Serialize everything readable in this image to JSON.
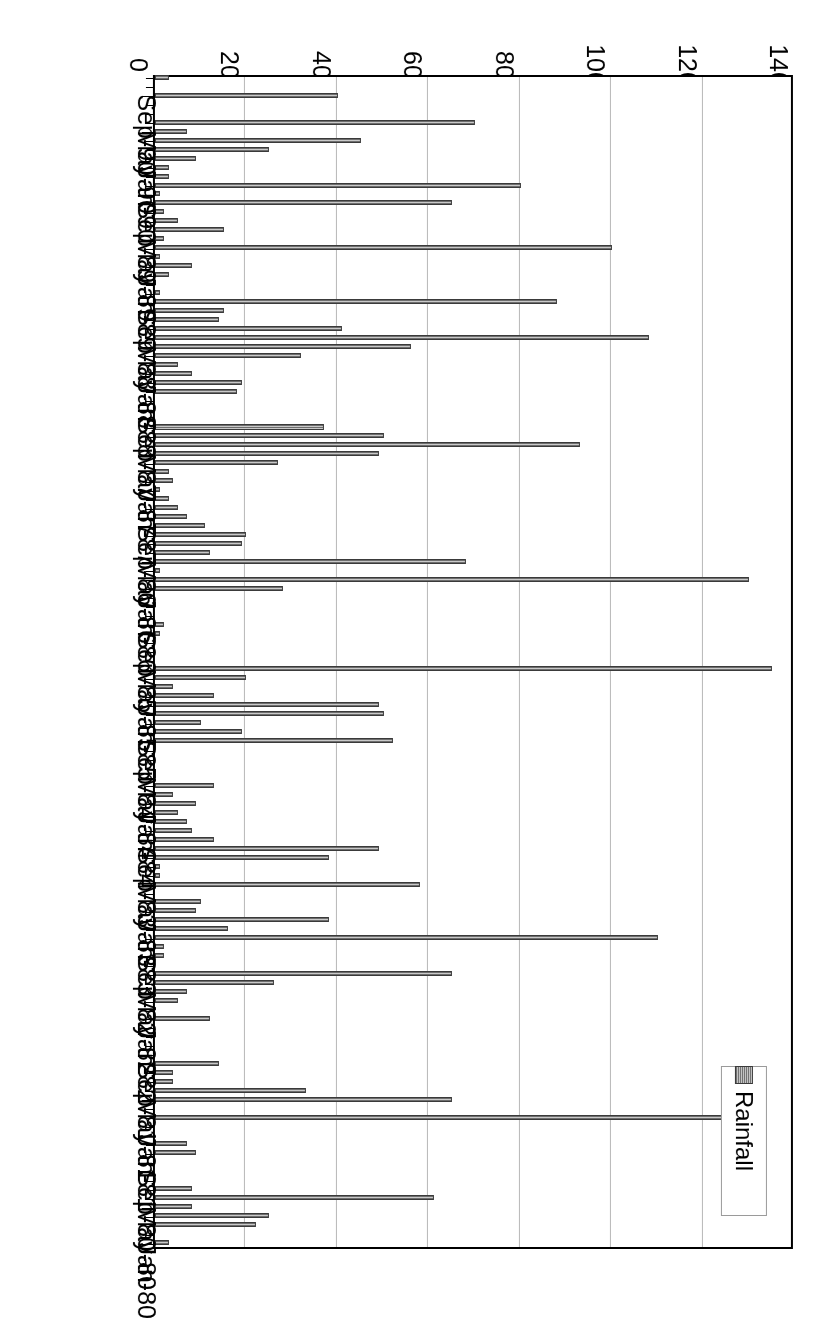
{
  "chart_data": {
    "type": "bar",
    "orientation": "horizontal",
    "title": "",
    "xlabel": "mm",
    "ylabel": "Date",
    "xlim": [
      0,
      140
    ],
    "xticks": [
      0,
      20,
      40,
      60,
      80,
      100,
      120,
      140
    ],
    "grid": true,
    "legend": {
      "position": "top-left",
      "entries": [
        "Rainfall"
      ]
    },
    "series_name": "Rainfall",
    "series_color": "#9a9a9a",
    "axis_color": "#000000",
    "gridline_color": "#b8b8b8",
    "tick_label_interval_months": 4,
    "categories": [
      "Jan-80",
      "Feb-80",
      "Mar-80",
      "Apr-80",
      "May-80",
      "Jun-80",
      "Jul-80",
      "Aug-80",
      "Sep-80",
      "Oct-80",
      "Nov-80",
      "Dec-80",
      "Jan-81",
      "Feb-81",
      "Mar-81",
      "Apr-81",
      "May-81",
      "Jun-81",
      "Jul-81",
      "Aug-81",
      "Sep-81",
      "Oct-81",
      "Nov-81",
      "Dec-81",
      "Jan-82",
      "Feb-82",
      "Mar-82",
      "Apr-82",
      "May-82",
      "Jun-82",
      "Jul-82",
      "Aug-82",
      "Sep-82",
      "Oct-82",
      "Nov-82",
      "Dec-82",
      "Jan-83",
      "Feb-83",
      "Mar-83",
      "Apr-83",
      "May-83",
      "Jun-83",
      "Jul-83",
      "Aug-83",
      "Sep-83",
      "Oct-83",
      "Nov-83",
      "Dec-83",
      "Jan-84",
      "Feb-84",
      "Mar-84",
      "Apr-84",
      "May-84",
      "Jun-84",
      "Jul-84",
      "Aug-84",
      "Sep-84",
      "Oct-84",
      "Nov-84",
      "Dec-84",
      "Jan-85",
      "Feb-85",
      "Mar-85",
      "Apr-85",
      "May-85",
      "Jun-85",
      "Jul-85",
      "Aug-85",
      "Sep-85",
      "Oct-85",
      "Nov-85",
      "Dec-85",
      "Jan-86",
      "Feb-86",
      "Mar-86",
      "Apr-86",
      "May-86",
      "Jun-86",
      "Jul-86",
      "Aug-86",
      "Sep-86",
      "Oct-86",
      "Nov-86",
      "Dec-86",
      "Jan-87",
      "Feb-87",
      "Mar-87",
      "Apr-87",
      "May-87",
      "Jun-87",
      "Jul-87",
      "Aug-87",
      "Sep-87",
      "Oct-87",
      "Nov-87",
      "Dec-87",
      "Jan-88",
      "Feb-88",
      "Mar-88",
      "Apr-88",
      "May-88",
      "Jun-88",
      "Jul-88",
      "Aug-88",
      "Sep-88",
      "Oct-88",
      "Nov-88",
      "Dec-88",
      "Jan-89",
      "Feb-89",
      "Mar-89",
      "Apr-89",
      "May-89",
      "Jun-89",
      "Jul-89",
      "Aug-89",
      "Sep-89",
      "Oct-89",
      "Nov-89",
      "Dec-89",
      "Jan-90",
      "Feb-90",
      "Mar-90",
      "Apr-90",
      "May-90",
      "Jun-90",
      "Jul-90",
      "Aug-90",
      "Sep-90",
      "Oct-90",
      "Nov-90"
    ],
    "values": [
      3,
      0,
      22,
      25,
      8,
      61,
      8,
      0,
      0,
      0,
      9,
      7,
      0,
      0,
      127,
      0,
      65,
      33,
      4,
      4,
      14,
      0,
      0,
      0,
      0,
      12,
      0,
      5,
      7,
      26,
      65,
      0,
      2,
      2,
      110,
      16,
      38,
      9,
      10,
      0,
      58,
      1,
      1,
      38,
      49,
      13,
      8,
      7,
      5,
      9,
      4,
      13,
      0,
      0,
      0,
      0,
      52,
      19,
      10,
      50,
      49,
      13,
      4,
      20,
      135,
      0,
      0,
      0,
      1,
      2,
      0,
      0,
      0,
      28,
      130,
      1,
      68,
      12,
      19,
      20,
      11,
      7,
      5,
      3,
      1,
      4,
      3,
      27,
      49,
      93,
      50,
      37,
      0,
      0,
      0,
      18,
      19,
      8,
      5,
      32,
      56,
      108,
      41,
      14,
      15,
      88,
      1,
      0,
      3,
      8,
      1,
      100,
      2,
      15,
      5,
      2,
      65,
      1,
      80,
      3,
      3,
      9,
      25,
      45,
      7,
      70,
      0,
      0,
      40,
      0,
      3
    ]
  },
  "legend": {
    "swatch_name": "rainfall-swatch",
    "label": "Rainfall"
  },
  "axes": {
    "value_axis_title": "mm",
    "category_axis_title": "Date",
    "value_tick_labels": [
      "140",
      "120",
      "100",
      "80",
      "60",
      "40",
      "20",
      "0"
    ],
    "category_tick_labels": [
      "Jan-80",
      "May-80",
      "Sep-80",
      "Jan-81",
      "May-81",
      "Sep-81",
      "Jan-82",
      "May-82",
      "Sep-82",
      "Jan-83",
      "May-83",
      "Sep-83",
      "Jan-84",
      "May-84",
      "Sep-84",
      "Jan-85",
      "May-85",
      "Sep-85",
      "Jan-86",
      "May-86",
      "Sep-86",
      "Jan-87",
      "May-87",
      "Sep-87",
      "Jan-88",
      "May-88",
      "Sep-88",
      "Jan-89",
      "May-89",
      "Sep-89",
      "Jan-90",
      "May-90",
      "Sep-90"
    ]
  }
}
